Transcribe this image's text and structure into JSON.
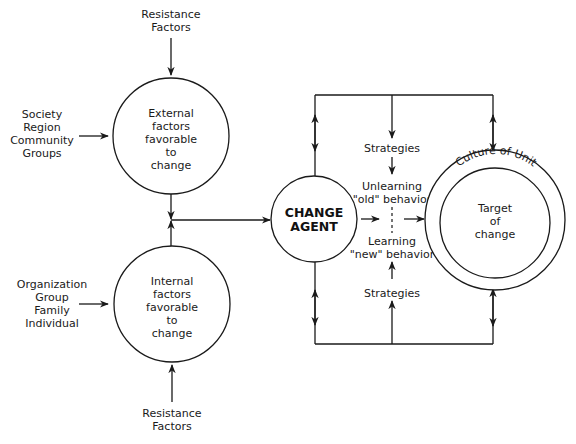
{
  "diagram": {
    "type": "change-model-flow",
    "colors": {
      "line": "#1a1a1a",
      "background": "#ffffff",
      "text": "#1a1a1a"
    },
    "top_resistance": {
      "lines": [
        "Resistance",
        "Factors"
      ]
    },
    "bottom_resistance": {
      "lines": [
        "Resistance",
        "Factors"
      ]
    },
    "external_sources": {
      "lines": [
        "Society",
        "Region",
        "Community",
        "Groups"
      ]
    },
    "internal_sources": {
      "lines": [
        "Organization",
        "Group",
        "Family",
        "Individual"
      ]
    },
    "external_circle": {
      "lines": [
        "External",
        "factors",
        "favorable",
        "to",
        "change"
      ]
    },
    "internal_circle": {
      "lines": [
        "Internal",
        "factors",
        "favorable",
        "to",
        "change"
      ]
    },
    "change_agent": {
      "lines": [
        "CHANGE",
        "AGENT"
      ]
    },
    "strategies_top": "Strategies",
    "strategies_bottom": "Strategies",
    "unlearning": {
      "lines": [
        "Unlearning",
        "\"old\" behavior"
      ]
    },
    "learning": {
      "lines": [
        "Learning",
        "\"new\" behavior"
      ]
    },
    "culture_ring_label": "Culture of Unit",
    "target": {
      "lines": [
        "Target",
        "of",
        "change"
      ]
    }
  }
}
